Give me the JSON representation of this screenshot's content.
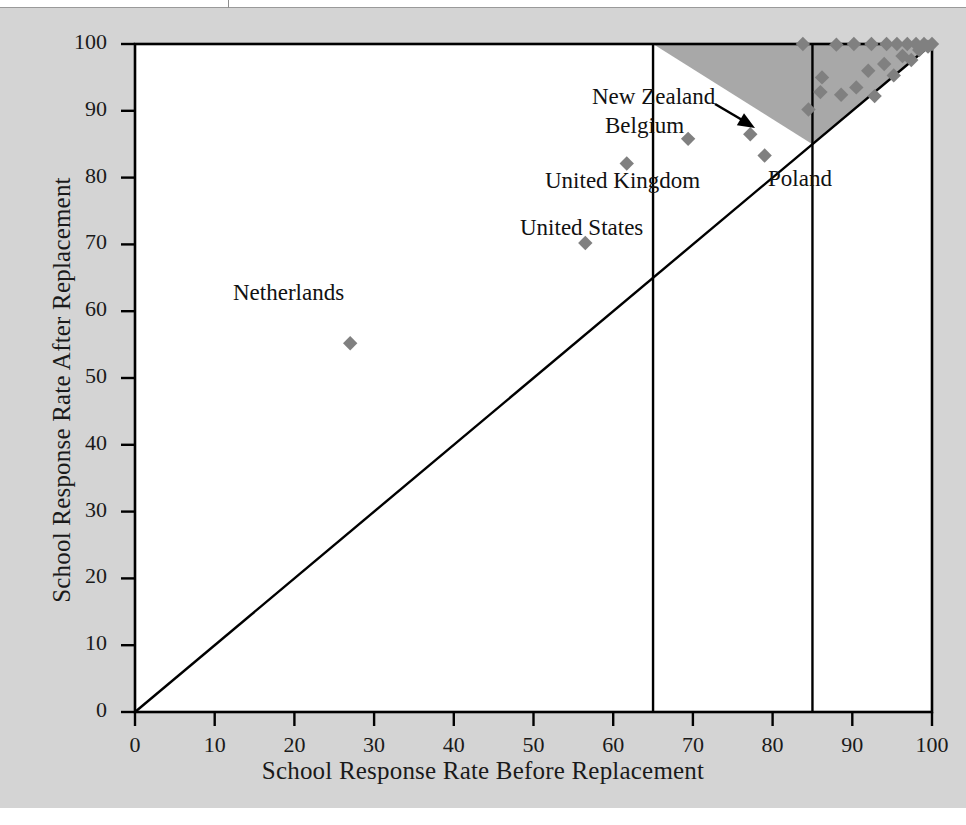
{
  "figure": {
    "background_color": "#d4d4d4",
    "plot_background_color": "#ffffff",
    "marker_color": "#808080",
    "shade_color": "#a8a8a8",
    "line_color": "#000000"
  },
  "chart_data": {
    "type": "scatter",
    "title": "",
    "xlabel": "School Response Rate Before Replacement",
    "ylabel": "School Response Rate After Replacement",
    "xlim": [
      0,
      100
    ],
    "ylim": [
      0,
      100
    ],
    "xticks": [
      0,
      10,
      20,
      30,
      40,
      50,
      60,
      70,
      80,
      90,
      100
    ],
    "yticks": [
      0,
      10,
      20,
      30,
      40,
      50,
      60,
      70,
      80,
      90,
      100
    ],
    "xticklabels": [
      "0",
      "10",
      "20",
      "30",
      "40",
      "50",
      "60",
      "70",
      "80",
      "90",
      "100"
    ],
    "yticklabels": [
      "0",
      "10",
      "20",
      "30",
      "40",
      "50",
      "60",
      "70",
      "80",
      "90",
      "100"
    ],
    "grid": false,
    "legend": null,
    "reference_lines": [
      {
        "name": "identity-line",
        "type": "diagonal",
        "from": [
          0,
          0
        ],
        "to": [
          100,
          100
        ]
      },
      {
        "name": "before-threshold-65",
        "type": "vertical",
        "x": 65
      },
      {
        "name": "before-threshold-85",
        "type": "vertical",
        "x": 85
      }
    ],
    "shaded_region": {
      "name": "acceptable-region",
      "vertices": [
        [
          65,
          100
        ],
        [
          100,
          100
        ],
        [
          85,
          85
        ]
      ],
      "fill": "#a8a8a8"
    },
    "points": [
      {
        "label": "Netherlands",
        "x": 27.0,
        "y": 55.2
      },
      {
        "label": "United States",
        "x": 56.5,
        "y": 70.2
      },
      {
        "label": "United Kingdom",
        "x": 61.7,
        "y": 82.1
      },
      {
        "label": "Belgium",
        "x": 69.4,
        "y": 85.8
      },
      {
        "label": "New Zealand",
        "x": 77.2,
        "y": 86.5
      },
      {
        "label": "Poland",
        "x": 79.0,
        "y": 83.3
      },
      {
        "label": "",
        "x": 83.8,
        "y": 100.0
      },
      {
        "label": "",
        "x": 84.5,
        "y": 90.2
      },
      {
        "label": "",
        "x": 86.0,
        "y": 92.8
      },
      {
        "label": "",
        "x": 88.0,
        "y": 99.9
      },
      {
        "label": "",
        "x": 86.2,
        "y": 95.0
      },
      {
        "label": "",
        "x": 88.6,
        "y": 92.4
      },
      {
        "label": "",
        "x": 90.2,
        "y": 100.0
      },
      {
        "label": "",
        "x": 90.5,
        "y": 93.5
      },
      {
        "label": "",
        "x": 92.0,
        "y": 96.0
      },
      {
        "label": "",
        "x": 92.4,
        "y": 100.0
      },
      {
        "label": "",
        "x": 92.8,
        "y": 92.2
      },
      {
        "label": "",
        "x": 94.0,
        "y": 97.0
      },
      {
        "label": "",
        "x": 94.3,
        "y": 100.0
      },
      {
        "label": "",
        "x": 95.2,
        "y": 95.3
      },
      {
        "label": "",
        "x": 95.6,
        "y": 100.0
      },
      {
        "label": "",
        "x": 96.3,
        "y": 98.2
      },
      {
        "label": "",
        "x": 96.9,
        "y": 100.0
      },
      {
        "label": "",
        "x": 97.4,
        "y": 97.6
      },
      {
        "label": "",
        "x": 98.0,
        "y": 100.0
      },
      {
        "label": "",
        "x": 98.4,
        "y": 99.1
      },
      {
        "label": "",
        "x": 99.0,
        "y": 100.0
      },
      {
        "label": "",
        "x": 99.5,
        "y": 99.6
      },
      {
        "label": "",
        "x": 100.0,
        "y": 100.0
      }
    ],
    "annotations": [
      {
        "name": "new-zealand-label",
        "text": "New Zealand",
        "x_px": 592,
        "y_px": 84
      },
      {
        "name": "belgium-label",
        "text": "Belgium",
        "x_px": 605,
        "y_px": 113
      },
      {
        "name": "united-kingdom-label",
        "text": "United Kingdom",
        "x_px": 545,
        "y_px": 168
      },
      {
        "name": "united-states-label",
        "text": "United States",
        "x_px": 520,
        "y_px": 215
      },
      {
        "name": "netherlands-label",
        "text": "Netherlands",
        "x_px": 233,
        "y_px": 280
      },
      {
        "name": "poland-label",
        "text": "Poland",
        "x_px": 768,
        "y_px": 166
      }
    ],
    "arrow": {
      "name": "new-zealand-arrow",
      "from_px": [
        715,
        104
      ],
      "to_px": [
        755,
        128
      ]
    }
  }
}
